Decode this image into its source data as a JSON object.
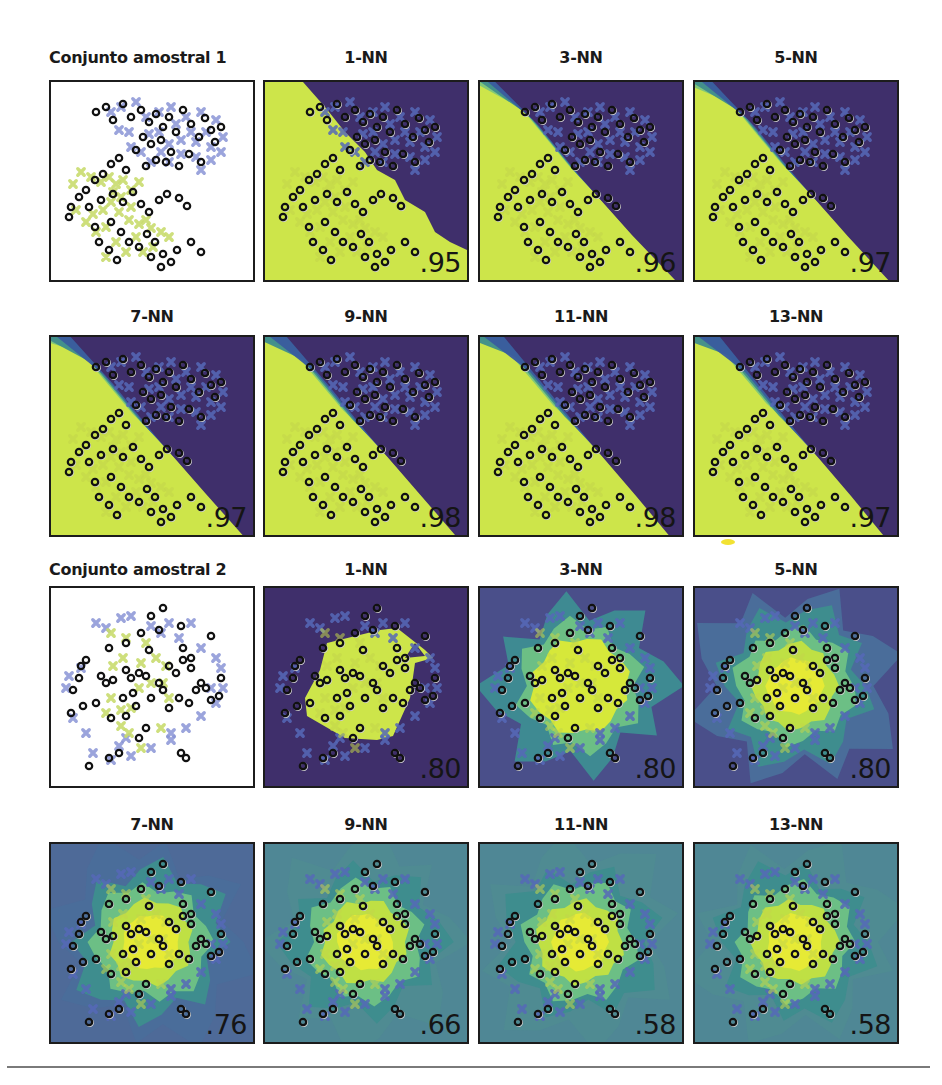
{
  "colors": {
    "purple": "#3f2f6b",
    "blue": "#3a5c9e",
    "teal": "#3f8d8c",
    "green": "#6ab88a",
    "lime": "#cde54a",
    "yellow": "#dde93a",
    "cross_blue": "#5669b8",
    "cross_lime": "#b9cf55",
    "ring": "#111111"
  },
  "chart_data": [
    {
      "type": "scatter",
      "title": "Conjunto amostral 1",
      "description": "Two overlapping gaussian clusters: blue crosses (upper right), yellow-green crosses (lower left), black rings = test points",
      "panels": [
        {
          "title": "Conjunto amostral 1",
          "score": ""
        },
        {
          "title": "1-NN",
          "score": ".95"
        },
        {
          "title": "3-NN",
          "score": ".96"
        },
        {
          "title": "5-NN",
          "score": ".97"
        },
        {
          "title": "7-NN",
          "score": ".97"
        },
        {
          "title": "9-NN",
          "score": ".98"
        },
        {
          "title": "11-NN",
          "score": ".98"
        },
        {
          "title": "13-NN",
          "score": ".97"
        }
      ]
    },
    {
      "type": "scatter",
      "title": "Conjunto amostral 2",
      "description": "Concentric data: yellow-green class in center, blue class around the ring; black rings = test points",
      "panels": [
        {
          "title": "Conjunto amostral 2",
          "score": ""
        },
        {
          "title": "1-NN",
          "score": ".80"
        },
        {
          "title": "3-NN",
          "score": ".80"
        },
        {
          "title": "5-NN",
          "score": ".80"
        },
        {
          "title": "7-NN",
          "score": ".76"
        },
        {
          "title": "9-NN",
          "score": ".66"
        },
        {
          "title": "11-NN",
          "score": ".58"
        },
        {
          "title": "13-NN",
          "score": ".58"
        }
      ]
    }
  ],
  "set1": {
    "rings": [
      [
        45,
        30
      ],
      [
        55,
        25
      ],
      [
        62,
        38
      ],
      [
        72,
        22
      ],
      [
        80,
        35
      ],
      [
        90,
        28
      ],
      [
        98,
        40
      ],
      [
        105,
        32
      ],
      [
        112,
        45
      ],
      [
        118,
        35
      ],
      [
        125,
        50
      ],
      [
        132,
        28
      ],
      [
        140,
        42
      ],
      [
        148,
        55
      ],
      [
        154,
        36
      ],
      [
        160,
        48
      ],
      [
        164,
        60
      ],
      [
        170,
        45
      ],
      [
        110,
        58
      ],
      [
        100,
        62
      ],
      [
        92,
        55
      ],
      [
        85,
        68
      ],
      [
        120,
        70
      ],
      [
        138,
        72
      ],
      [
        150,
        80
      ],
      [
        128,
        84
      ],
      [
        115,
        80
      ],
      [
        105,
        78
      ],
      [
        95,
        84
      ],
      [
        75,
        88
      ],
      [
        68,
        76
      ],
      [
        60,
        82
      ],
      [
        52,
        92
      ],
      [
        44,
        98
      ],
      [
        35,
        108
      ],
      [
        28,
        115
      ],
      [
        20,
        125
      ],
      [
        18,
        135
      ],
      [
        38,
        125
      ],
      [
        50,
        118
      ],
      [
        62,
        112
      ],
      [
        72,
        120
      ],
      [
        82,
        110
      ],
      [
        90,
        122
      ],
      [
        98,
        130
      ],
      [
        108,
        118
      ],
      [
        116,
        112
      ],
      [
        128,
        116
      ],
      [
        136,
        124
      ],
      [
        60,
        140
      ],
      [
        70,
        150
      ],
      [
        78,
        160
      ],
      [
        88,
        165
      ],
      [
        96,
        152
      ],
      [
        104,
        160
      ],
      [
        112,
        172
      ],
      [
        120,
        180
      ],
      [
        126,
        168
      ],
      [
        140,
        160
      ],
      [
        150,
        170
      ],
      [
        58,
        168
      ],
      [
        66,
        178
      ],
      [
        48,
        160
      ],
      [
        44,
        145
      ],
      [
        100,
        175
      ],
      [
        110,
        185
      ]
    ],
    "blue": [
      [
        60,
        30
      ],
      [
        70,
        25
      ],
      [
        85,
        20
      ],
      [
        95,
        35
      ],
      [
        108,
        30
      ],
      [
        120,
        25
      ],
      [
        135,
        35
      ],
      [
        150,
        30
      ],
      [
        165,
        38
      ],
      [
        172,
        55
      ],
      [
        160,
        65
      ],
      [
        145,
        60
      ],
      [
        130,
        58
      ],
      [
        118,
        62
      ],
      [
        108,
        50
      ],
      [
        98,
        52
      ],
      [
        125,
        42
      ],
      [
        140,
        50
      ],
      [
        155,
        50
      ],
      [
        110,
        70
      ],
      [
        130,
        72
      ],
      [
        145,
        75
      ],
      [
        118,
        80
      ],
      [
        100,
        80
      ],
      [
        90,
        70
      ],
      [
        78,
        50
      ],
      [
        68,
        48
      ],
      [
        80,
        65
      ],
      [
        150,
        88
      ],
      [
        160,
        78
      ],
      [
        170,
        70
      ]
    ],
    "lime": [
      [
        30,
        90
      ],
      [
        40,
        95
      ],
      [
        50,
        100
      ],
      [
        58,
        95
      ],
      [
        65,
        102
      ],
      [
        72,
        98
      ],
      [
        80,
        108
      ],
      [
        88,
        100
      ],
      [
        70,
        115
      ],
      [
        60,
        120
      ],
      [
        52,
        128
      ],
      [
        42,
        132
      ],
      [
        35,
        140
      ],
      [
        45,
        150
      ],
      [
        55,
        145
      ],
      [
        68,
        130
      ],
      [
        78,
        138
      ],
      [
        88,
        142
      ],
      [
        95,
        138
      ],
      [
        100,
        146
      ],
      [
        85,
        155
      ],
      [
        75,
        170
      ],
      [
        65,
        160
      ],
      [
        55,
        175
      ],
      [
        92,
        170
      ],
      [
        102,
        165
      ],
      [
        110,
        150
      ],
      [
        118,
        155
      ],
      [
        22,
        102
      ],
      [
        25,
        128
      ],
      [
        80,
        125
      ],
      [
        62,
        110
      ]
    ]
  },
  "set2": {
    "rings": [
      [
        112,
        20
      ],
      [
        100,
        28
      ],
      [
        90,
        45
      ],
      [
        108,
        42
      ],
      [
        130,
        38
      ],
      [
        160,
        48
      ],
      [
        58,
        60
      ],
      [
        75,
        55
      ],
      [
        98,
        62
      ],
      [
        132,
        60
      ],
      [
        140,
        70
      ],
      [
        30,
        78
      ],
      [
        35,
        72
      ],
      [
        28,
        90
      ],
      [
        22,
        102
      ],
      [
        50,
        88
      ],
      [
        55,
        95
      ],
      [
        62,
        92
      ],
      [
        75,
        82
      ],
      [
        80,
        90
      ],
      [
        88,
        85
      ],
      [
        95,
        88
      ],
      [
        108,
        95
      ],
      [
        118,
        78
      ],
      [
        125,
        85
      ],
      [
        132,
        72
      ],
      [
        140,
        80
      ],
      [
        150,
        95
      ],
      [
        170,
        90
      ],
      [
        168,
        108
      ],
      [
        155,
        100
      ],
      [
        138,
        115
      ],
      [
        128,
        110
      ],
      [
        118,
        120
      ],
      [
        112,
        102
      ],
      [
        100,
        110
      ],
      [
        82,
        105
      ],
      [
        72,
        110
      ],
      [
        85,
        118
      ],
      [
        75,
        128
      ],
      [
        60,
        130
      ],
      [
        45,
        115
      ],
      [
        32,
        118
      ],
      [
        20,
        125
      ],
      [
        95,
        140
      ],
      [
        88,
        150
      ],
      [
        68,
        165
      ],
      [
        58,
        170
      ],
      [
        38,
        178
      ],
      [
        130,
        165
      ],
      [
        135,
        170
      ],
      [
        160,
        112
      ],
      [
        145,
        102
      ]
    ],
    "blue": [
      [
        45,
        35
      ],
      [
        70,
        30
      ],
      [
        80,
        28
      ],
      [
        100,
        38
      ],
      [
        110,
        45
      ],
      [
        128,
        50
      ],
      [
        150,
        60
      ],
      [
        165,
        70
      ],
      [
        170,
        80
      ],
      [
        172,
        100
      ],
      [
        165,
        115
      ],
      [
        150,
        128
      ],
      [
        135,
        140
      ],
      [
        120,
        152
      ],
      [
        100,
        160
      ],
      [
        80,
        168
      ],
      [
        60,
        172
      ],
      [
        42,
        165
      ],
      [
        35,
        145
      ],
      [
        22,
        130
      ],
      [
        15,
        100
      ],
      [
        18,
        88
      ],
      [
        30,
        80
      ],
      [
        55,
        40
      ],
      [
        118,
        35
      ],
      [
        140,
        35
      ],
      [
        160,
        100
      ],
      [
        75,
        150
      ],
      [
        68,
        158
      ],
      [
        120,
        145
      ]
    ],
    "lime": [
      [
        60,
        45
      ],
      [
        75,
        50
      ],
      [
        95,
        55
      ],
      [
        105,
        70
      ],
      [
        115,
        78
      ],
      [
        100,
        95
      ],
      [
        88,
        100
      ],
      [
        80,
        120
      ],
      [
        70,
        122
      ],
      [
        60,
        110
      ],
      [
        62,
        78
      ],
      [
        72,
        70
      ],
      [
        90,
        75
      ],
      [
        112,
        95
      ],
      [
        118,
        110
      ],
      [
        110,
        140
      ],
      [
        90,
        160
      ],
      [
        78,
        145
      ],
      [
        70,
        138
      ],
      [
        55,
        125
      ]
    ]
  }
}
